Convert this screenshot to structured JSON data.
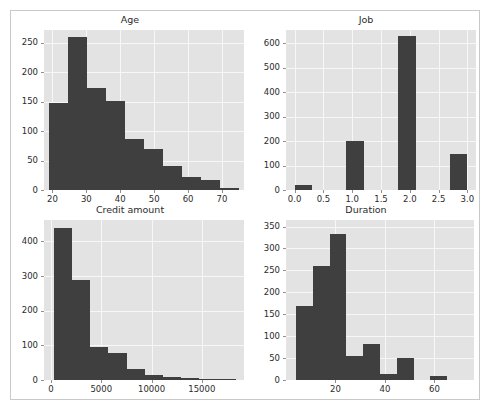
{
  "figure": {
    "background_color": "#ffffff",
    "border_color": "#c9c9c9",
    "panel_background": "#e3e3e3",
    "grid_color": "#f7f7f7",
    "bar_color": "#3f3f3f",
    "text_color": "#2b2b2b"
  },
  "chart_data": [
    {
      "id": "age",
      "type": "bar",
      "title": "Age",
      "xlabel": "",
      "ylabel": "",
      "grid": true,
      "legend": null,
      "xlim": [
        17.5,
        76.5
      ],
      "ylim": [
        0,
        272
      ],
      "xticks": [
        20,
        30,
        40,
        50,
        60,
        70
      ],
      "xticklabels": [
        "20",
        "30",
        "40",
        "50",
        "60",
        "70"
      ],
      "yticks": [
        0,
        50,
        100,
        150,
        200,
        250
      ],
      "yticklabels": [
        "0",
        "50",
        "100",
        "150",
        "200",
        "250"
      ],
      "bin_edges": [
        19,
        24.6,
        30.2,
        35.8,
        41.4,
        47,
        52.6,
        58.2,
        63.8,
        69.4,
        75
      ],
      "values": [
        148,
        260,
        174,
        152,
        87,
        69,
        40,
        22,
        17,
        3
      ]
    },
    {
      "id": "job",
      "type": "bar",
      "title": "Job",
      "xlabel": "",
      "ylabel": "",
      "grid": true,
      "legend": null,
      "xlim": [
        -0.15,
        3.15
      ],
      "ylim": [
        0,
        655
      ],
      "xticks": [
        0.0,
        0.5,
        1.0,
        1.5,
        2.0,
        2.5,
        3.0
      ],
      "xticklabels": [
        "0.0",
        "0.5",
        "1.0",
        "1.5",
        "2.0",
        "2.5",
        "3.0"
      ],
      "yticks": [
        0,
        100,
        200,
        300,
        400,
        500,
        600
      ],
      "yticklabels": [
        "0",
        "100",
        "200",
        "300",
        "400",
        "500",
        "600"
      ],
      "bin_edges": [
        0,
        0.3,
        0.6,
        0.9,
        1.2,
        1.5,
        1.8,
        2.1,
        2.4,
        2.7,
        3.0
      ],
      "values": [
        22,
        0,
        0,
        200,
        0,
        0,
        630,
        0,
        0,
        148
      ]
    },
    {
      "id": "credit_amount",
      "type": "bar",
      "title": "Credit amount",
      "xlabel": "",
      "ylabel": "",
      "grid": true,
      "legend": null,
      "xlim": [
        -700,
        19200
      ],
      "ylim": [
        0,
        462
      ],
      "xticks": [
        0,
        5000,
        10000,
        15000
      ],
      "xticklabels": [
        "0",
        "5000",
        "10000",
        "15000"
      ],
      "yticks": [
        0,
        100,
        200,
        300,
        400
      ],
      "yticklabels": [
        "0",
        "100",
        "200",
        "300",
        "400"
      ],
      "bin_edges": [
        250,
        2065,
        3880,
        5695,
        7510,
        9325,
        11140,
        12955,
        14770,
        16585,
        18400
      ],
      "values": [
        440,
        290,
        95,
        78,
        33,
        14,
        10,
        5,
        3,
        2
      ]
    },
    {
      "id": "duration",
      "type": "bar",
      "title": "Duration",
      "xlabel": "",
      "ylabel": "",
      "grid": true,
      "legend": null,
      "xlim": [
        0,
        76
      ],
      "ylim": [
        0,
        365
      ],
      "xticks": [
        20,
        40,
        60
      ],
      "xticklabels": [
        "20",
        "40",
        "60"
      ],
      "yticks": [
        0,
        50,
        100,
        150,
        200,
        250,
        300,
        350
      ],
      "yticklabels": [
        "0",
        "50",
        "100",
        "150",
        "200",
        "250",
        "300",
        "350"
      ],
      "bin_edges": [
        4,
        10.8,
        17.6,
        24.4,
        31.2,
        38,
        44.8,
        51.6,
        58.4,
        65.2,
        72
      ],
      "values": [
        168,
        260,
        333,
        55,
        83,
        14,
        50,
        0,
        9,
        0
      ]
    }
  ]
}
